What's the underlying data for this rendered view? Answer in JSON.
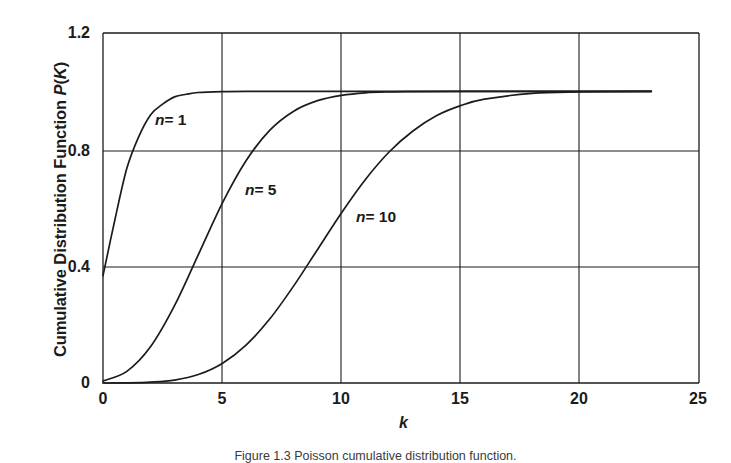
{
  "figure": {
    "caption": "Figure 1.3  Poisson cumulative distribution function."
  },
  "axes": {
    "y_title_pre": "Cumulative Distribution Function ",
    "y_title_italic": "P",
    "y_title_post": "(",
    "y_title_italic2": "K",
    "y_title_post2": ")",
    "x_title": "k"
  },
  "labels": {
    "n1": {
      "n": "n",
      "eq": "= 1"
    },
    "n5": {
      "n": "n",
      "eq": "= 5"
    },
    "n10": {
      "n": "n",
      "eq": "= 10"
    }
  },
  "chart_data": {
    "type": "line",
    "title": "Poisson cumulative distribution function",
    "xlabel": "k",
    "ylabel": "Cumulative Distribution Function P(K)",
    "xlim": [
      0,
      25
    ],
    "ylim": [
      0,
      1.2
    ],
    "xticks": [
      0,
      5,
      10,
      15,
      20,
      25
    ],
    "yticks": [
      0,
      0.4,
      0.8,
      1.2
    ],
    "xtick_labels": [
      "0",
      "5",
      "10",
      "15",
      "20",
      "25"
    ],
    "ytick_labels": [
      "0",
      "0.4",
      "0.8",
      "1.2"
    ],
    "grid": true,
    "legend": "inline-annotations",
    "line_color": "#1b1b1b",
    "series": [
      {
        "name": "n = 1",
        "annotation": "n = 1",
        "x": [
          0,
          0.5,
          1,
          1.5,
          2,
          2.5,
          3,
          3.5,
          4,
          5,
          6,
          8,
          10,
          12,
          15,
          18,
          20,
          23
        ],
        "values": [
          0.368,
          0.56,
          0.736,
          0.845,
          0.92,
          0.956,
          0.981,
          0.99,
          0.996,
          0.999,
          1.0,
          1.0,
          1.0,
          1.0,
          1.0,
          1.0,
          1.0,
          1.0
        ]
      },
      {
        "name": "n = 5",
        "annotation": "n = 5",
        "x": [
          0,
          1,
          2,
          3,
          4,
          5,
          6,
          7,
          8,
          9,
          10,
          11,
          12,
          13,
          15,
          18,
          20,
          23
        ],
        "values": [
          0.007,
          0.04,
          0.125,
          0.265,
          0.44,
          0.616,
          0.762,
          0.867,
          0.932,
          0.968,
          0.986,
          0.995,
          0.998,
          0.999,
          1.0,
          1.0,
          1.0,
          1.0
        ]
      },
      {
        "name": "n = 10",
        "annotation": "n = 10",
        "x": [
          0,
          1,
          2,
          3,
          4,
          5,
          6,
          7,
          8,
          9,
          10,
          11,
          12,
          13,
          14,
          15,
          16,
          18,
          20,
          23
        ],
        "values": [
          0.0,
          0.0005,
          0.003,
          0.01,
          0.029,
          0.067,
          0.13,
          0.22,
          0.333,
          0.458,
          0.583,
          0.697,
          0.792,
          0.864,
          0.917,
          0.951,
          0.973,
          0.993,
          0.998,
          1.0
        ]
      }
    ]
  }
}
